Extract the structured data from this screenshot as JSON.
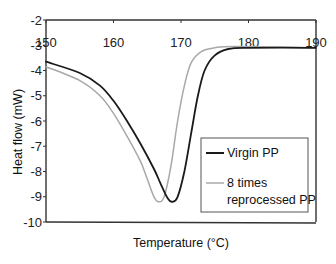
{
  "chart_data": {
    "type": "line",
    "title": "",
    "xlabel": "Temperature (°C)",
    "ylabel": "Heat flow (mW)",
    "xlim": [
      150,
      190
    ],
    "ylim": [
      -10,
      -2
    ],
    "x_ticks": [
      150,
      160,
      170,
      180,
      190
    ],
    "y_ticks": [
      -2,
      -3,
      -4,
      -5,
      -6,
      -7,
      -8,
      -9,
      -10
    ],
    "x_axis_position": "top",
    "grid": false,
    "legend_position": "lower right",
    "series": [
      {
        "name": "Virgin PP",
        "color": "#1a1a1a",
        "x": [
          150,
          155,
          158,
          160,
          162,
          164,
          166,
          167,
          168,
          168.7,
          169.5,
          170.5,
          171.5,
          172.5,
          173.5,
          175,
          177,
          180,
          190
        ],
        "y": [
          -3.65,
          -4.1,
          -4.6,
          -5.2,
          -6.0,
          -6.9,
          -7.9,
          -8.5,
          -9.05,
          -9.2,
          -9.0,
          -8.0,
          -6.5,
          -5.0,
          -4.0,
          -3.4,
          -3.15,
          -3.1,
          -3.1
        ]
      },
      {
        "name": "8 times reprocessed PP",
        "color": "#a8a8a8",
        "x": [
          150,
          155,
          158,
          160,
          162,
          164,
          165,
          166,
          166.7,
          167.5,
          168.5,
          169.5,
          170.5,
          171.5,
          173,
          175,
          178,
          190
        ],
        "y": [
          -3.85,
          -4.4,
          -5.0,
          -5.7,
          -6.6,
          -7.6,
          -8.3,
          -9.0,
          -9.2,
          -9.0,
          -7.8,
          -6.0,
          -4.6,
          -3.7,
          -3.25,
          -3.1,
          -3.05,
          -3.1
        ]
      }
    ]
  },
  "legend": {
    "items": [
      {
        "label_lines": [
          "Virgin PP"
        ]
      },
      {
        "label_lines": [
          "8 times",
          "reprocessed PP"
        ]
      }
    ]
  }
}
